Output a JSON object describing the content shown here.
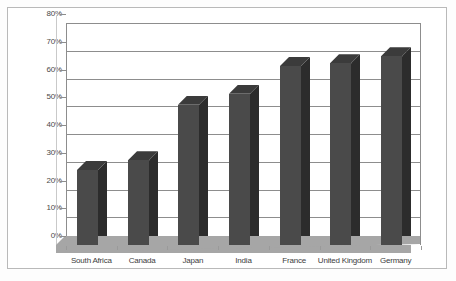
{
  "chart_data": {
    "type": "bar",
    "title": "",
    "subtitle": "",
    "xlabel": "",
    "ylabel": "",
    "ylim": [
      0,
      80
    ],
    "ytick_values": [
      80,
      70,
      60,
      50,
      40,
      30,
      20,
      10,
      0
    ],
    "ytick_labels": [
      "80%",
      "70%",
      "60%",
      "50%",
      "40%",
      "30%",
      "20%",
      "10%",
      "0%"
    ],
    "grid": true,
    "legend": "none",
    "style": "3d-column",
    "categories": [
      "South Africa",
      "Canada",
      "Japan",
      "India",
      "France",
      "United Kingdom",
      "Germany"
    ],
    "values": [
      27,
      30.5,
      50.5,
      54.5,
      64.5,
      65.5,
      68
    ],
    "value_labels": [
      "27%",
      "30.5%",
      "50.5%",
      "54.5%",
      "64.5%",
      "65.5%",
      "68%"
    ],
    "colors": {
      "bar_front": "#4a4a4a",
      "bar_side": "#2c2c2c",
      "bar_top": "#3b3b3b",
      "gridline": "#8d8d8d",
      "floor": "#a6a6a6",
      "frame": "#b9b9b9",
      "background": "#ffffff",
      "tick_text": "#4a4a4a"
    }
  }
}
